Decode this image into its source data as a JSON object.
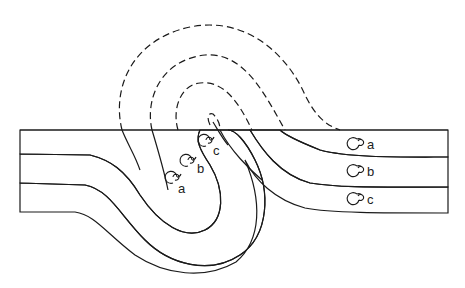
{
  "diagram": {
    "title": "",
    "colors": {
      "stipple": "#9a9a9a",
      "line": "#1a1a1a",
      "background": "#ffffff"
    },
    "layers": [
      {
        "id": "a",
        "fill": "stippled"
      },
      {
        "id": "b",
        "fill": "plain"
      },
      {
        "id": "c",
        "fill": "stippled"
      }
    ],
    "fossil_labels": {
      "left_limb": [
        "a",
        "b",
        "c"
      ],
      "right_limb": [
        "a",
        "b",
        "c"
      ]
    },
    "surface_line": "ground surface",
    "eroded_portion": "dashed"
  }
}
